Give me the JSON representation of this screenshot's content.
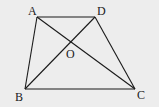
{
  "figure": {
    "type": "trapezoid with diagonals",
    "background": "#ededed",
    "stroke_color": "#1a1a1a",
    "points": {
      "A": {
        "label": "A",
        "x": 37,
        "y": 17
      },
      "D": {
        "label": "D",
        "x": 95,
        "y": 17
      },
      "B": {
        "label": "B",
        "x": 25,
        "y": 89
      },
      "C": {
        "label": "C",
        "x": 135,
        "y": 89
      },
      "O": {
        "label": "O",
        "x": 71,
        "y": 42
      }
    },
    "segments": [
      "AD",
      "AB",
      "DC",
      "BC",
      "AC",
      "BD"
    ]
  }
}
